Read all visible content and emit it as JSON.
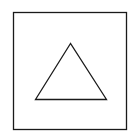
{
  "diagram": {
    "background": "#ffffff",
    "stroke_color": "#1a1a1a",
    "shapes": [
      {
        "type": "square",
        "x": 13.5,
        "y": 12.5,
        "width": 113,
        "height": 117,
        "stroke_width": 1.3
      },
      {
        "type": "triangle",
        "points": "70.5,43.5 35.5,99.5 106.5,99.5",
        "stroke_width": 1.3
      }
    ]
  }
}
